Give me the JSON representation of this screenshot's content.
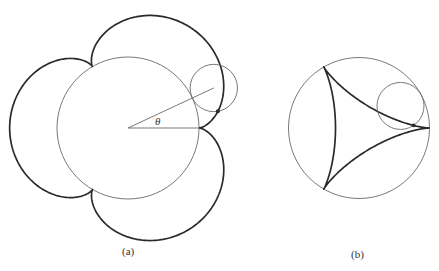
{
  "figure_a": {
    "label": "(a)",
    "label_pos": [
      122,
      255
    ],
    "curve_type": "epicycloid",
    "fixed_circle": {
      "cx": 128,
      "cy": 128,
      "r": 71
    },
    "rolling_circle_radius": 23.67,
    "cusps": 3,
    "rolling_circle_angle_deg": 25,
    "angle_label": "θ",
    "angle_label_pos": [
      155,
      125
    ],
    "tracing_point_marked": true
  },
  "figure_b": {
    "label": "(b)",
    "label_pos": [
      351,
      258
    ],
    "curve_type": "hypocycloid (deltoid)",
    "fixed_circle": {
      "cx": 359,
      "cy": 128,
      "r": 70.5
    },
    "rolling_circle_radius": 23.5,
    "cusps": 3,
    "rolling_circle_angle_deg": 28,
    "tracing_point_marked": true
  },
  "colors": {
    "thin_line": "#6a6a6a",
    "curve": "#2a2a2a",
    "background": "#ffffff"
  }
}
